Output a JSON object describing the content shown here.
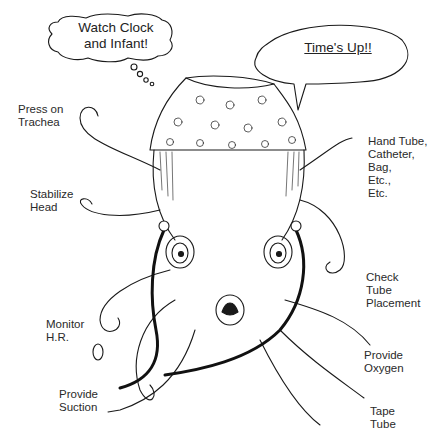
{
  "illustration": {
    "subject": "octopus wearing floral cap performing neonatal resuscitation tasks",
    "thought_bubble": {
      "text": "Watch Clock\nand Infant!"
    },
    "speech_bubble": {
      "text": "Time's Up!!"
    },
    "labels_left": [
      {
        "id": "press-trachea",
        "text": "Press on\nTrachea"
      },
      {
        "id": "stabilize-head",
        "text": "Stabilize\nHead"
      },
      {
        "id": "monitor-hr",
        "text": "Monitor\nH.R."
      },
      {
        "id": "provide-suction",
        "text": "Provide\nSuction"
      }
    ],
    "labels_right": [
      {
        "id": "hand-tube",
        "text": "Hand Tube,\nCatheter,\nBag,\nEtc.,\nEtc."
      },
      {
        "id": "check-tube",
        "text": "Check\nTube\nPlacement"
      },
      {
        "id": "provide-oxygen",
        "text": "Provide\nOxygen"
      },
      {
        "id": "tape-tube",
        "text": "Tape\nTube"
      }
    ],
    "colors": {
      "line": "#1a1a1a",
      "background": "#ffffff",
      "stethoscope": "#111111"
    }
  }
}
